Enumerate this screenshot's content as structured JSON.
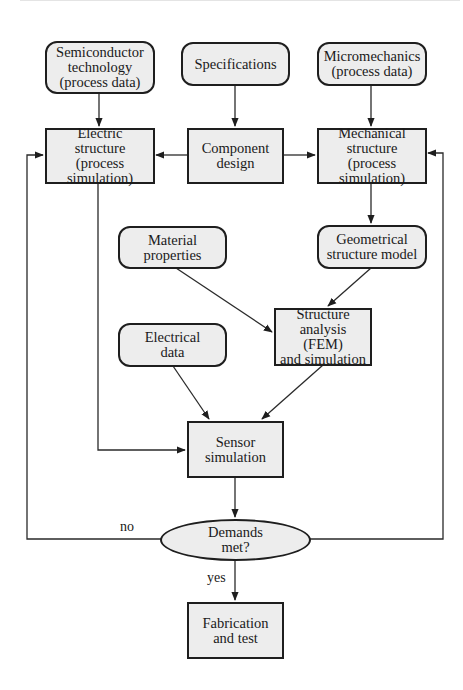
{
  "diagram": {
    "type": "flowchart",
    "colors": {
      "node_fill": "#ededed",
      "stroke": "#1e1e1e",
      "background": "#ffffff"
    },
    "nodes": {
      "semiconductor": {
        "label": "Semiconductor\ntechnology\n(process data)",
        "shape": "rounded"
      },
      "specifications": {
        "label": "Specifications",
        "shape": "rounded"
      },
      "micromechanics": {
        "label": "Micromechanics\n(process data)",
        "shape": "rounded"
      },
      "electric_structure": {
        "label": "Electric\nstructure (process\nsimulation)",
        "shape": "rect"
      },
      "component_design": {
        "label": "Component\ndesign",
        "shape": "rect"
      },
      "mechanical_structure": {
        "label": "Mechanical\nstructure (process\nsimulation)",
        "shape": "rect"
      },
      "material_properties": {
        "label": "Material\nproperties",
        "shape": "rounded"
      },
      "geometrical_model": {
        "label": "Geometrical\nstructure model",
        "shape": "rounded"
      },
      "electrical_data": {
        "label": "Electrical\ndata",
        "shape": "rounded"
      },
      "structure_analysis": {
        "label": "Structure\nanalysis (FEM)\nand simulation",
        "shape": "rect"
      },
      "sensor_simulation": {
        "label": "Sensor\nsimulation",
        "shape": "rect"
      },
      "demands_met": {
        "label": "Demands\nmet?",
        "shape": "ellipse"
      },
      "fabrication": {
        "label": "Fabrication\nand test",
        "shape": "rect"
      }
    },
    "edge_labels": {
      "no": "no",
      "yes": "yes"
    },
    "edges": [
      {
        "from": "semiconductor",
        "to": "electric_structure"
      },
      {
        "from": "specifications",
        "to": "component_design"
      },
      {
        "from": "micromechanics",
        "to": "mechanical_structure"
      },
      {
        "from": "component_design",
        "to": "electric_structure"
      },
      {
        "from": "component_design",
        "to": "mechanical_structure"
      },
      {
        "from": "mechanical_structure",
        "to": "geometrical_model"
      },
      {
        "from": "geometrical_model",
        "to": "structure_analysis"
      },
      {
        "from": "material_properties",
        "to": "structure_analysis"
      },
      {
        "from": "electrical_data",
        "to": "sensor_simulation"
      },
      {
        "from": "structure_analysis",
        "to": "sensor_simulation"
      },
      {
        "from": "electric_structure",
        "to": "sensor_simulation"
      },
      {
        "from": "sensor_simulation",
        "to": "demands_met"
      },
      {
        "from": "demands_met",
        "to": "electric_structure",
        "label": "no"
      },
      {
        "from": "demands_met",
        "to": "mechanical_structure"
      },
      {
        "from": "demands_met",
        "to": "fabrication",
        "label": "yes"
      }
    ]
  }
}
